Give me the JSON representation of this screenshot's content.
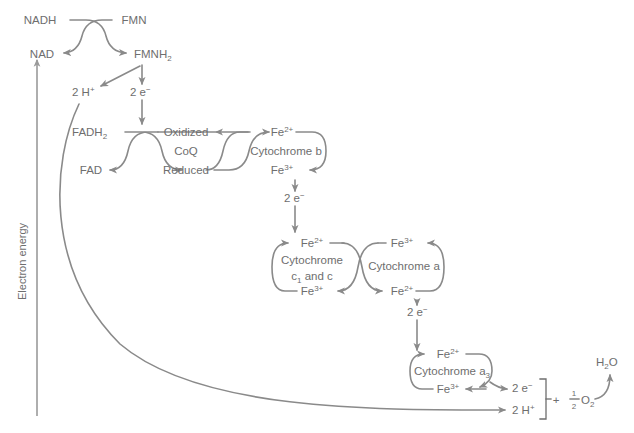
{
  "diagram": {
    "axis": {
      "label": "Electron energy",
      "direction": "up"
    },
    "colors": {
      "stroke": "#8a8a8a",
      "text": "#6e6e6e",
      "background": "#ffffff",
      "axis": "#9a9a9a"
    },
    "nodes": {
      "nadh": "NADH",
      "nad": "NAD",
      "fmn": "FMN",
      "fmnh2_base": "FMNH",
      "fmnh2_sub": "2",
      "two_h_plus_top_num": "2 H",
      "two_h_plus_top_sup": "+",
      "two_e_minus_1_num": "2 e",
      "two_e_minus_1_sup": "−",
      "fadh2_base": "FADH",
      "fadh2_sub": "2",
      "fad": "FAD",
      "coq_oxidized": "Oxidized",
      "coq_name": "CoQ",
      "coq_reduced": "Reduced",
      "cytb_fe2_base": "Fe",
      "cytb_fe2_sup": "2+",
      "cytb_name": "Cytochrome b",
      "cytb_fe3_base": "Fe",
      "cytb_fe3_sup": "3+",
      "two_e_minus_2_num": "2 e",
      "two_e_minus_2_sup": "−",
      "cytc_fe2_base": "Fe",
      "cytc_fe2_sup": "2+",
      "cytc_name_line1": "Cytochrome",
      "cytc_name_line2_base": "c",
      "cytc_name_line2_sub": "1",
      "cytc_name_line2_rest": " and c",
      "cytc_fe3_base": "Fe",
      "cytc_fe3_sup": "3+",
      "cyta_fe3_base": "Fe",
      "cyta_fe3_sup": "3+",
      "cyta_name": "Cytochrome a",
      "cyta_fe2_base": "Fe",
      "cyta_fe2_sup": "2+",
      "two_e_minus_3_num": "2 e",
      "two_e_minus_3_sup": "−",
      "cyta3_fe2_base": "Fe",
      "cyta3_fe2_sup": "2+",
      "cyta3_name_base": "Cytochrome a",
      "cyta3_name_sub": "3",
      "cyta3_fe3_base": "Fe",
      "cyta3_fe3_sup": "3+",
      "two_e_minus_4_num": "2 e",
      "two_e_minus_4_sup": "−",
      "two_h_plus_bottom_num": "2 H",
      "two_h_plus_bottom_sup": "+",
      "plus_sign": "+",
      "half_numerator": "1",
      "half_denominator": "2",
      "o2_base": "O",
      "o2_sub": "2",
      "water_base": "H",
      "water_sub": "2",
      "water_rest": "O"
    }
  }
}
